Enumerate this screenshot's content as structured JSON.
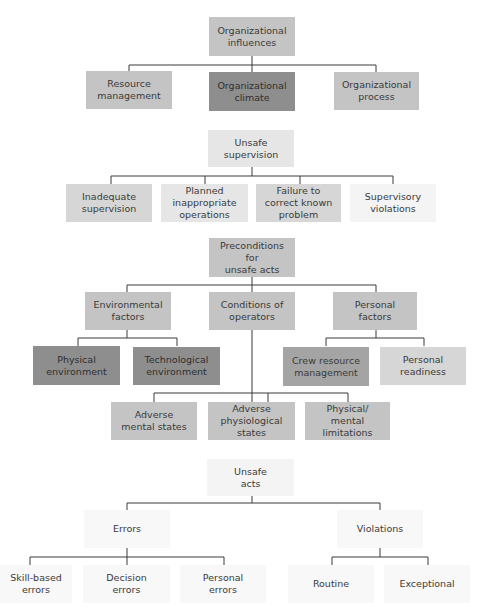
{
  "diagram": {
    "type": "hierarchy",
    "colors": {
      "dark": "#8e8e8e",
      "mid_dark": "#a4a4a4",
      "medium": "#c4c4c4",
      "light_medium": "#d6d6d6",
      "light": "#e6e6e6",
      "very_light": "#f4f4f4",
      "near_white": "#f8f8f8",
      "connector": "#3a3a3a"
    },
    "level1": {
      "root": "Organizational\ninfluences",
      "children": [
        "Resource\nmanagement",
        "Organizational\nclimate",
        "Organizational\nprocess"
      ]
    },
    "level2": {
      "root": "Unsafe\nsupervision",
      "children": [
        "Inadequate\nsupervision",
        "Planned\ninappropriate\noperations",
        "Failure to\ncorrect known\nproblem",
        "Supervisory\nviolations"
      ]
    },
    "level3": {
      "root": "Preconditions for\nunsafe acts",
      "children": [
        {
          "label": "Environmental\nfactors",
          "children": [
            "Physical\nenvironment",
            "Technological\nenvironment"
          ]
        },
        {
          "label": "Conditions of\noperators",
          "children": [
            "Adverse\nmental states",
            "Adverse\nphysiological\nstates",
            "Physical/\nmental\nlimitations"
          ]
        },
        {
          "label": "Personal\nfactors",
          "children": [
            "Crew resource\nmanagement",
            "Personal\nreadiness"
          ]
        }
      ]
    },
    "level4": {
      "root": "Unsafe\nacts",
      "children": [
        {
          "label": "Errors",
          "children": [
            "Skill-based\nerrors",
            "Decision\nerrors",
            "Personal\nerrors"
          ]
        },
        {
          "label": "Violations",
          "children": [
            "Routine",
            "Exceptional"
          ]
        }
      ]
    }
  }
}
